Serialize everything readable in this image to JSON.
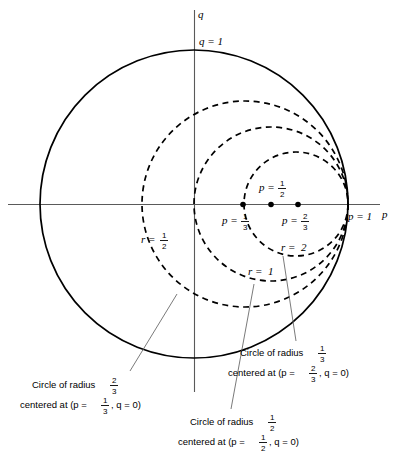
{
  "figure": {
    "background_color": "#ffffff",
    "line_color": "#000000",
    "axis_color": "#5a5a5a",
    "leader_color": "#6b6b6b"
  },
  "axes": {
    "vertical_label": "q",
    "horizontal_label": "p",
    "origin_px": {
      "x": 194,
      "y": 204
    },
    "unit_px": 154
  },
  "axis_ticks": [
    {
      "name": "q-equals-1",
      "text": "q = 1",
      "x": 196,
      "y": 41
    },
    {
      "name": "p-equals-1",
      "text": "p = 1",
      "x": 350,
      "y": 217
    }
  ],
  "marked_points": [
    {
      "name": "point-p-one-third",
      "p": 0.3333,
      "q": 0,
      "cx": 243,
      "cy": 204,
      "label_prefix": "p =",
      "num": "1",
      "den": "3",
      "label_x": 222,
      "label_y": 224,
      "label_position": "below"
    },
    {
      "name": "point-p-one-half",
      "p": 0.5,
      "q": 0,
      "cx": 271,
      "cy": 204,
      "label_prefix": "p =",
      "num": "1",
      "den": "2",
      "label_x": 259,
      "label_y": 190,
      "label_position": "above"
    },
    {
      "name": "point-p-two-thirds",
      "p": 0.6667,
      "q": 0,
      "cx": 298,
      "cy": 204,
      "label_prefix": "p =",
      "num": "2",
      "den": "3",
      "label_x": 282,
      "label_y": 224,
      "label_position": "below"
    }
  ],
  "circles": [
    {
      "name": "unit-circle-q-equals-1",
      "style": "solid",
      "center_p": 0,
      "center_q": 0,
      "radius_units": 1,
      "cx": 194,
      "cy": 204,
      "r": 154
    },
    {
      "name": "constant-r-half-circle",
      "style": "dashed",
      "r_value": "1/2",
      "center_p": 0.3333,
      "center_q": 0,
      "radius_units": 0.6667,
      "cx": 245,
      "cy": 204,
      "r": 103
    },
    {
      "name": "constant-r-one-circle",
      "style": "dashed",
      "r_value": "1",
      "center_p": 0.5,
      "center_q": 0,
      "radius_units": 0.5,
      "cx": 271,
      "cy": 204,
      "r": 77
    },
    {
      "name": "constant-r-two-circle",
      "style": "dashed",
      "r_value": "2",
      "center_p": 0.6667,
      "center_q": 0,
      "radius_units": 0.3333,
      "cx": 296,
      "cy": 204,
      "r": 52
    }
  ],
  "circle_labels": [
    {
      "name": "label-r-half",
      "prefix": "r =",
      "num": "1",
      "den": "2",
      "x": 141,
      "y": 241
    },
    {
      "name": "label-r-one",
      "prefix": "r =",
      "text": "1",
      "x": 248,
      "y": 274
    },
    {
      "name": "label-r-two",
      "prefix": "r =",
      "text": "2",
      "x": 281,
      "y": 250
    }
  ],
  "captions": [
    {
      "name": "caption-radius-two-thirds",
      "line1_prefix": "Circle of radius",
      "line1_num": "2",
      "line1_den": "3",
      "line2_prefix": "centered at (p =",
      "line2_num": "1",
      "line2_den": "3",
      "line2_suffix": ", q = 0)",
      "x": 103,
      "y": 385,
      "leader": {
        "x1": 130,
        "y1": 371,
        "x2": 177,
        "y2": 294
      }
    },
    {
      "name": "caption-radius-one-half",
      "line1_prefix": "Circle of radius",
      "line1_num": "1",
      "line1_den": "2",
      "line2_prefix": "centered at (p =",
      "line2_num": "1",
      "line2_den": "2",
      "line2_suffix": ", q = 0)",
      "x": 267,
      "y": 422,
      "leader": {
        "x1": 231,
        "y1": 409,
        "x2": 254,
        "y2": 284
      }
    },
    {
      "name": "caption-radius-one-third",
      "line1_prefix": "Circle of radius",
      "line1_num": "1",
      "line1_den": "3",
      "line2_prefix": "centered at (p =",
      "line2_num": "2",
      "line2_den": "3",
      "line2_suffix": ", q = 0)",
      "x": 315,
      "y": 353,
      "leader": {
        "x1": 296,
        "y1": 341,
        "x2": 283,
        "y2": 256
      }
    }
  ]
}
